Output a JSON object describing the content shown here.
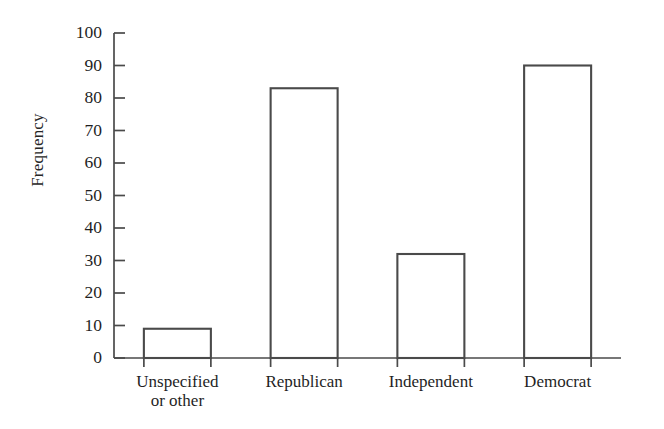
{
  "chart_data": {
    "type": "bar",
    "title": "",
    "xlabel": "",
    "ylabel": "Frequency",
    "categories": [
      "Unspecified\nor other",
      "Republican",
      "Independent",
      "Democrat"
    ],
    "values": [
      9,
      83,
      32,
      90
    ],
    "ylim": [
      0,
      100
    ],
    "y_ticks": [
      0,
      10,
      20,
      30,
      40,
      50,
      60,
      70,
      80,
      90,
      100
    ],
    "y_tick_labels": [
      "0",
      "10",
      "20",
      "30",
      "40",
      "50",
      "60",
      "70",
      "80",
      "90",
      "100"
    ],
    "grid": false,
    "legend": false,
    "legend_position": "none",
    "bar_fill_color": "#ffffff",
    "bar_edge_color": "#4a4a4a",
    "axis_color": "#4a4a4a",
    "background_color": "#ffffff"
  },
  "axes": {
    "y_title": "Frequency"
  }
}
